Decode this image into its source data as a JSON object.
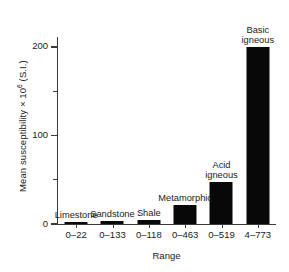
{
  "chart_data": {
    "type": "bar",
    "title": "",
    "subtitle": "",
    "xlabel": "Range",
    "ylabel": "Mean susceptibility × 10⁶ (S.I.)",
    "ylabel_parts": {
      "before": "Mean susceptibility × 10",
      "exponent": "6",
      "after": " (S.I.)"
    },
    "categories": [
      "0–22",
      "0–133",
      "0–118",
      "0–463",
      "0–519",
      "4–773"
    ],
    "bar_labels": [
      "Limestone",
      "Sandstone",
      "Shale",
      "Metamorphic",
      "Acid igneous",
      "Basic igneous"
    ],
    "values": [
      2,
      3,
      5,
      22,
      47,
      200
    ],
    "ylim": [
      0,
      210
    ],
    "yticks": [
      0,
      100,
      200
    ],
    "ytick_labels": [
      "0",
      "100",
      "200"
    ],
    "yticks_minor": [
      50,
      150
    ],
    "grid": false,
    "legend": "none",
    "bar_color": "#080808",
    "axis_color": "#3b3b3b",
    "background_color": "#ffffff",
    "bars": [
      {
        "label": "Limestone",
        "label_lines": [
          "Limestone"
        ],
        "range": "0–22",
        "value": 2
      },
      {
        "label": "Sandstone",
        "label_lines": [
          "Sandstone"
        ],
        "range": "0–133",
        "value": 3
      },
      {
        "label": "Shale",
        "label_lines": [
          "Shale"
        ],
        "range": "0–118",
        "value": 5
      },
      {
        "label": "Metamorphic",
        "label_lines": [
          "Metamorphic"
        ],
        "range": "0–463",
        "value": 22
      },
      {
        "label": "Acid igneous",
        "label_lines": [
          "Acid",
          "igneous"
        ],
        "range": "0–519",
        "value": 47
      },
      {
        "label": "Basic igneous",
        "label_lines": [
          "Basic",
          "igneous"
        ],
        "range": "4–773",
        "value": 200
      }
    ]
  }
}
